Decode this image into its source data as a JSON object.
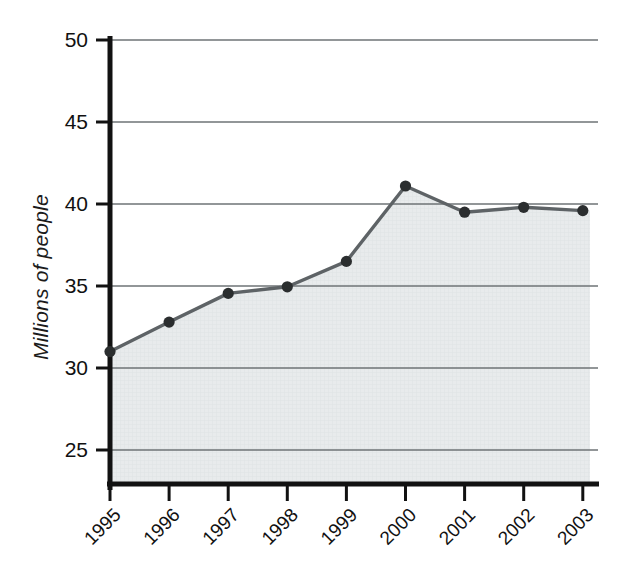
{
  "chart_data": {
    "type": "area",
    "title": "",
    "subtitle": "",
    "xlabel": "",
    "ylabel": "Millions of people",
    "categories": [
      "1995",
      "1996",
      "1997",
      "1998",
      "1999",
      "2000",
      "2001",
      "2002",
      "2003"
    ],
    "values": [
      31.0,
      32.8,
      34.55,
      34.95,
      36.5,
      41.1,
      39.5,
      39.8,
      39.6
    ],
    "series": [
      {
        "name": "Millions of people",
        "values": [
          31.0,
          32.8,
          34.55,
          34.95,
          36.5,
          41.1,
          39.5,
          39.8,
          39.6
        ]
      }
    ],
    "ylim": [
      23.0,
      50.0
    ],
    "y_ticks": [
      25,
      30,
      35,
      40,
      45,
      50
    ],
    "y_tick_labels": [
      "25",
      "30",
      "35",
      "40",
      "45",
      "50"
    ],
    "x_tick_labels": [
      "1995",
      "1996",
      "1997",
      "1998",
      "1999",
      "2000",
      "2001",
      "2002",
      "2003"
    ],
    "grid": true,
    "grid_axis": "y",
    "legend": false,
    "legend_position": "none",
    "marker": "circle",
    "x_tick_label_rotation": -45,
    "colors": {
      "line": "#5e6366",
      "marker": "#2b2e2f",
      "area_fill": "#e6e9ea",
      "gridline": "#6e7376",
      "axis": "#121212",
      "background": "#ffffff",
      "text": "#111111"
    }
  },
  "axes": {
    "y_axis_title": "Millions of people",
    "y_ticks": [
      {
        "label": "50",
        "value": 50
      },
      {
        "label": "45",
        "value": 45
      },
      {
        "label": "40",
        "value": 40
      },
      {
        "label": "35",
        "value": 35
      },
      {
        "label": "30",
        "value": 30
      },
      {
        "label": "25",
        "value": 25
      }
    ],
    "x_ticks": [
      {
        "label": "1995",
        "value": 31.0
      },
      {
        "label": "1996",
        "value": 32.8
      },
      {
        "label": "1997",
        "value": 34.55
      },
      {
        "label": "1998",
        "value": 34.95
      },
      {
        "label": "1999",
        "value": 36.5
      },
      {
        "label": "2000",
        "value": 41.1
      },
      {
        "label": "2001",
        "value": 39.5
      },
      {
        "label": "2002",
        "value": 39.8
      },
      {
        "label": "2003",
        "value": 39.6
      }
    ]
  }
}
